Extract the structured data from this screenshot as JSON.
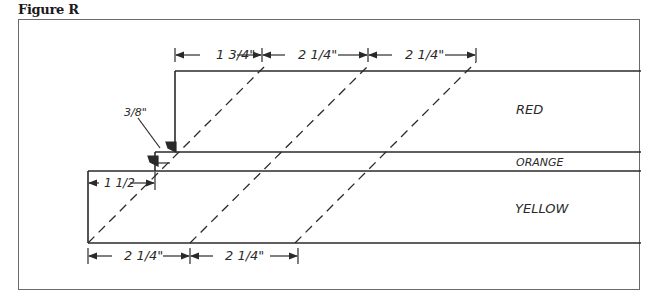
{
  "figure": {
    "title": "Figure R"
  },
  "labels": {
    "red": "RED",
    "orange": "ORANGE",
    "yellow": "YELLOW"
  },
  "dimensions": {
    "top": [
      "1 3/4\"",
      "2 1/4\"",
      "2 1/4\""
    ],
    "bottom": [
      "2 1/4\"",
      "2 1/4\""
    ],
    "left_offset": "1 1/2",
    "step": "3/8\""
  },
  "colors": {
    "line": "#2a2a2a",
    "frame": "#6a6a6a",
    "background": "#ffffff"
  }
}
